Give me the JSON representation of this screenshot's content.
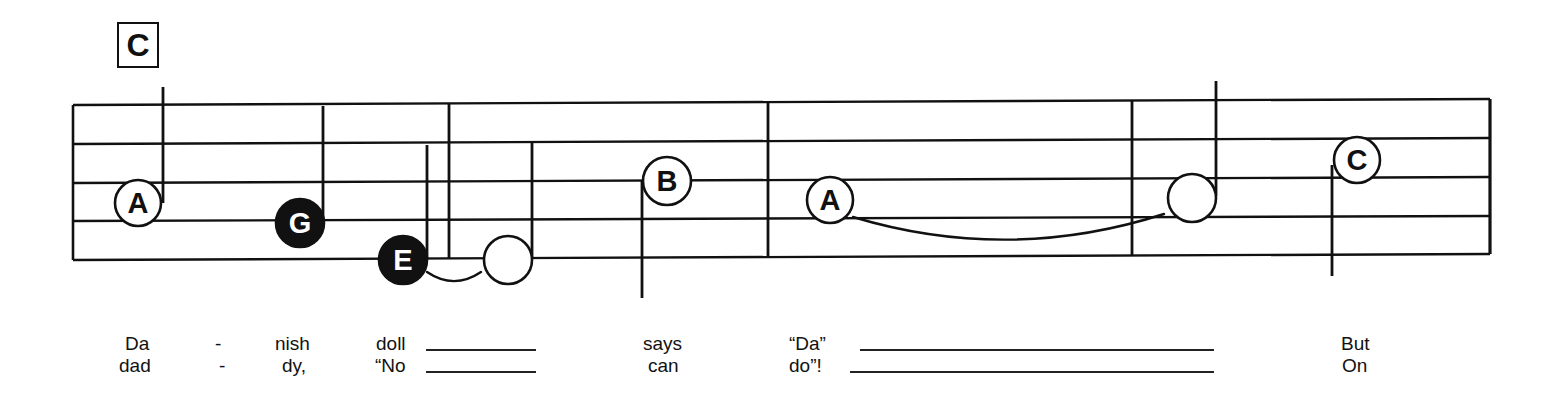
{
  "colors": {
    "ink": "#111111",
    "paper": "#ffffff"
  },
  "chord": {
    "label": "C",
    "x": 117,
    "y": 22,
    "w": 42,
    "h": 46
  },
  "staff": {
    "x_left": 73,
    "x_right": 1490,
    "lines_left_y": [
      105,
      144,
      183,
      221,
      260
    ],
    "lines_right_y": [
      99,
      138,
      177,
      216,
      254
    ]
  },
  "barlines": [
    {
      "x": 449
    },
    {
      "x": 768
    },
    {
      "x": 1132
    }
  ],
  "notes": [
    {
      "letter": "A",
      "cx": 138,
      "cy": 203,
      "r": 23,
      "filled": false,
      "labeled": true,
      "stem": {
        "x": 163,
        "y1": 87,
        "y2": 203
      }
    },
    {
      "letter": "G",
      "cx": 300,
      "cy": 223,
      "r": 24,
      "filled": true,
      "labeled": true,
      "stem": {
        "x": 323,
        "y1": 106,
        "y2": 223
      }
    },
    {
      "letter": "E",
      "cx": 403,
      "cy": 260,
      "r": 24,
      "filled": true,
      "labeled": true,
      "stem": {
        "x": 427,
        "y1": 145,
        "y2": 258
      }
    },
    {
      "letter": "",
      "cx": 508,
      "cy": 260,
      "r": 24,
      "filled": false,
      "labeled": false,
      "stem": {
        "x": 532,
        "y1": 143,
        "y2": 258
      }
    },
    {
      "letter": "B",
      "cx": 667,
      "cy": 181,
      "r": 24,
      "filled": false,
      "labeled": true,
      "stem": {
        "x": 642,
        "y1": 181,
        "y2": 298
      }
    },
    {
      "letter": "A",
      "cx": 830,
      "cy": 200,
      "r": 23,
      "filled": false,
      "labeled": true,
      "stem": null
    },
    {
      "letter": "",
      "cx": 1192,
      "cy": 198,
      "r": 24,
      "filled": false,
      "labeled": false,
      "stem": {
        "x": 1216,
        "y1": 81,
        "y2": 196
      }
    },
    {
      "letter": "C",
      "cx": 1357,
      "cy": 160,
      "r": 23,
      "filled": false,
      "labeled": true,
      "stem": {
        "x": 1332,
        "y1": 165,
        "y2": 276
      }
    }
  ],
  "ties": [
    {
      "x1": 427,
      "y1": 272,
      "x2": 481,
      "y2": 272,
      "depth": 14
    },
    {
      "x1": 853,
      "y1": 217,
      "x2": 1164,
      "y2": 214,
      "depth": 36
    }
  ],
  "lyrics": {
    "verse1": [
      {
        "text": "Da",
        "x": 125
      },
      {
        "text": "-",
        "x": 215
      },
      {
        "text": "nish",
        "x": 275
      },
      {
        "text": "doll",
        "x": 376
      },
      {
        "text": "says",
        "x": 643
      },
      {
        "text": "“Da”",
        "x": 789
      },
      {
        "text": "But",
        "x": 1341
      }
    ],
    "verse2": [
      {
        "text": "dad",
        "x": 119
      },
      {
        "text": "-",
        "x": 219
      },
      {
        "text": "dy,",
        "x": 282
      },
      {
        "text": "“No",
        "x": 375
      },
      {
        "text": "can",
        "x": 648
      },
      {
        "text": "do”!",
        "x": 789
      },
      {
        "text": "On",
        "x": 1342
      }
    ],
    "verse1_y": 333,
    "verse2_y": 355,
    "extenders": [
      {
        "verse": 1,
        "x1": 426,
        "x2": 536
      },
      {
        "verse": 2,
        "x1": 426,
        "x2": 536
      },
      {
        "verse": 1,
        "x1": 860,
        "x2": 1214
      },
      {
        "verse": 2,
        "x1": 850,
        "x2": 1214
      }
    ]
  }
}
